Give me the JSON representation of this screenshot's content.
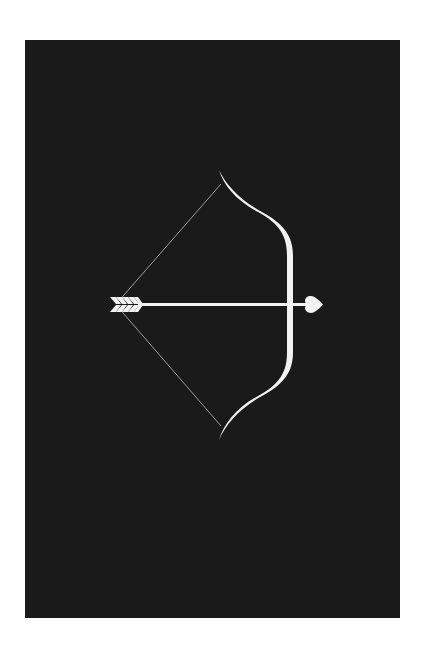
{
  "artwork": {
    "subject": "bow-and-arrow-with-heart-tip",
    "background_color": "#1a1a1a",
    "page_color": "#ffffff",
    "foreground_color": "#f2f2f2",
    "string_color": "#9a9a9a",
    "icons": [
      "bow-icon",
      "arrow-icon",
      "heart-arrowhead-icon",
      "fletching-icon",
      "bowstring-icon"
    ]
  }
}
